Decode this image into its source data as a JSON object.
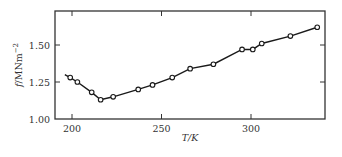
{
  "chart_data": {
    "type": "line",
    "title": "",
    "xlabel": "T/K",
    "ylabel": "f/MNm^-2",
    "ylabel_parts": {
      "main": "f/MNm",
      "sup": "−2"
    },
    "xlim": [
      190,
      342
    ],
    "ylim": [
      1.0,
      1.75
    ],
    "xticks": [
      200,
      250,
      300
    ],
    "xtick_labels": [
      "200",
      "250",
      "300"
    ],
    "yticks": [
      1.0,
      1.25,
      1.5
    ],
    "ytick_labels": [
      "1.00",
      "1.25",
      "1.50"
    ],
    "grid": false,
    "legend": null,
    "series": [
      {
        "name": "f vs T",
        "marker": "open-circle",
        "line_start": {
          "x": 196,
          "y": 1.3
        },
        "x": [
          199,
          203,
          211,
          216,
          223,
          237,
          245,
          256,
          266,
          279,
          295,
          301,
          306,
          322,
          337
        ],
        "y": [
          1.28,
          1.25,
          1.18,
          1.13,
          1.15,
          1.2,
          1.23,
          1.28,
          1.34,
          1.37,
          1.47,
          1.47,
          1.51,
          1.56,
          1.62
        ]
      }
    ],
    "colors": {
      "line": "#1a1a1a",
      "axis": "#333333",
      "marker_fill": "#ffffff"
    }
  }
}
